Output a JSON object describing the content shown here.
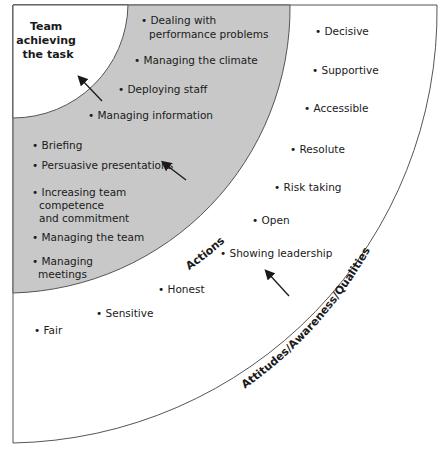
{
  "diagram": {
    "colors": {
      "actions_ring": "#c8c8c8",
      "background": "#ffffff",
      "stroke": "#555555",
      "text": "#1a1a1a"
    },
    "core": {
      "title_lines": [
        "Team",
        "achieving",
        "the task"
      ]
    },
    "actions": {
      "band_label": "Actions",
      "items": [
        {
          "lines": [
            "Dealing with",
            "performance problems"
          ]
        },
        {
          "lines": [
            "Managing the climate"
          ]
        },
        {
          "lines": [
            "Deploying staff"
          ]
        },
        {
          "lines": [
            "Managing information"
          ]
        },
        {
          "lines": [
            "Briefing"
          ]
        },
        {
          "lines": [
            "Persuasive presentations"
          ]
        },
        {
          "lines": [
            "Increasing team",
            "competence",
            "and commitment"
          ]
        },
        {
          "lines": [
            "Managing the team"
          ]
        },
        {
          "lines": [
            "Managing",
            "meetings"
          ]
        }
      ]
    },
    "qualities": {
      "band_label": "Attitudes/Awareness/Qualities",
      "items": [
        {
          "label": "Decisive"
        },
        {
          "label": "Supportive"
        },
        {
          "label": "Accessible"
        },
        {
          "label": "Resolute"
        },
        {
          "label": "Risk taking"
        },
        {
          "label": "Open"
        },
        {
          "label": "Showing leadership"
        },
        {
          "label": "Honest"
        },
        {
          "label": "Sensitive"
        },
        {
          "label": "Fair"
        }
      ]
    }
  }
}
